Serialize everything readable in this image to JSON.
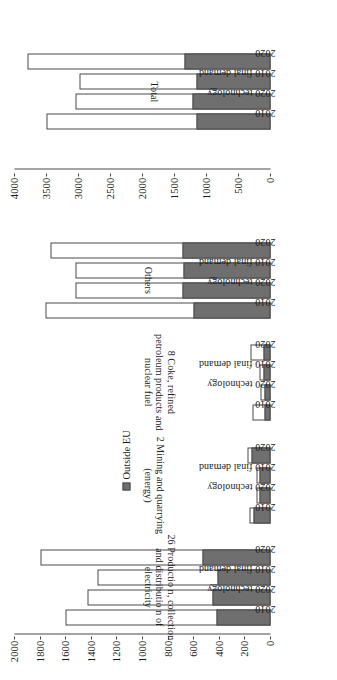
{
  "legend": {
    "items": [
      {
        "label": "Outside EU",
        "color": "#6f6f6f"
      }
    ]
  },
  "colors": {
    "outside_eu": "#6f6f6f",
    "inside": "#ffffff",
    "outline": "#4a4a4a"
  },
  "chart_data": {
    "type": "bar",
    "subtype": "stacked-bar, horizontal (figure rotated 90°)",
    "title": "",
    "xlabel": "",
    "ylabel": "",
    "legend_position": "center",
    "grid": false,
    "panels": [
      {
        "name": "main",
        "ylim": [
          0,
          2000
        ],
        "yticks": [
          0,
          200,
          400,
          600,
          800,
          1000,
          1200,
          1400,
          1600,
          1800,
          2000
        ],
        "ytick_labels": [
          "0",
          "200",
          "400",
          "600",
          "800",
          "1000",
          "1200",
          "1400",
          "1600",
          "1800",
          "2000"
        ],
        "categories": [
          "2010",
          "2020 technology",
          "2010 final demand",
          "2020"
        ],
        "series": [
          {
            "name": "Outside EU",
            "color": "#6f6f6f"
          },
          {
            "name": "Rest",
            "color": "#ffffff"
          }
        ],
        "groups": [
          {
            "label": "26 Productio n, collection and distributio n of electricity",
            "bars": [
              {
                "category": "2010",
                "total": 1600,
                "outside_eu": 420
              },
              {
                "category": "2020 technology",
                "total": 1430,
                "outside_eu": 450
              },
              {
                "category": "2010 final demand",
                "total": 1350,
                "outside_eu": 415
              },
              {
                "category": "2020",
                "total": 1800,
                "outside_eu": 530
              }
            ]
          },
          {
            "label": "2 Mining and quarrying (energy)",
            "bars": [
              {
                "category": "2010",
                "total": 165,
                "outside_eu": 130
              },
              {
                "category": "2020 technology",
                "total": 108,
                "outside_eu": 85
              },
              {
                "category": "2010 final demand",
                "total": 108,
                "outside_eu": 88
              },
              {
                "category": "2020",
                "total": 180,
                "outside_eu": 148
              }
            ]
          },
          {
            "label": "8 Coke, refined petroleum products and nuclear fuel",
            "bars": [
              {
                "category": "2010",
                "total": 142,
                "outside_eu": 48
              },
              {
                "category": "2020 technology",
                "total": 78,
                "outside_eu": 45
              },
              {
                "category": "2010 final demand",
                "total": 88,
                "outside_eu": 52
              },
              {
                "category": "2020",
                "total": 160,
                "outside_eu": 55
              }
            ]
          },
          {
            "label": "Others",
            "bars": [
              {
                "category": "2010",
                "total": 1760,
                "outside_eu": 600
              },
              {
                "category": "2020 technology",
                "total": 1520,
                "outside_eu": 690
              },
              {
                "category": "2010 final demand",
                "total": 1525,
                "outside_eu": 680
              },
              {
                "category": "2020",
                "total": 1720,
                "outside_eu": 690
              }
            ]
          }
        ]
      },
      {
        "name": "total",
        "ylim": [
          0,
          4000
        ],
        "yticks": [
          0,
          500,
          1000,
          1500,
          2000,
          2500,
          3000,
          3500,
          4000
        ],
        "ytick_labels": [
          "0",
          "500",
          "1000",
          "1500",
          "2000",
          "2500",
          "3000",
          "3500",
          "4000"
        ],
        "categories": [
          "2010",
          "2020 technology",
          "2010 final demand",
          "2020"
        ],
        "groups": [
          {
            "label": "Total",
            "bars": [
              {
                "category": "2010",
                "total": 3500,
                "outside_eu": 1160
              },
              {
                "category": "2020 technology",
                "total": 3045,
                "outside_eu": 1225
              },
              {
                "category": "2010 final demand",
                "total": 2990,
                "outside_eu": 1155
              },
              {
                "category": "2020",
                "total": 3800,
                "outside_eu": 1345
              }
            ]
          }
        ]
      }
    ]
  }
}
